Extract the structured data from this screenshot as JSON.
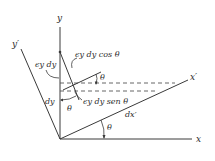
{
  "diagram": {
    "axes": {
      "x": "x",
      "y": "y",
      "x_prime": "x′",
      "y_prime": "y′"
    },
    "labels": {
      "eps_dy": "ϵy dy",
      "eps_dy_cos": "ϵy dy cos θ",
      "eps_dy_sen": "ϵy dy sen θ",
      "dy": "dy",
      "dx_prime": "dx′",
      "theta_top": "θ",
      "theta_mid": "θ",
      "theta_bottom": "θ"
    },
    "colors": {
      "line": "#3a3a3a",
      "dash": "#555555"
    }
  }
}
